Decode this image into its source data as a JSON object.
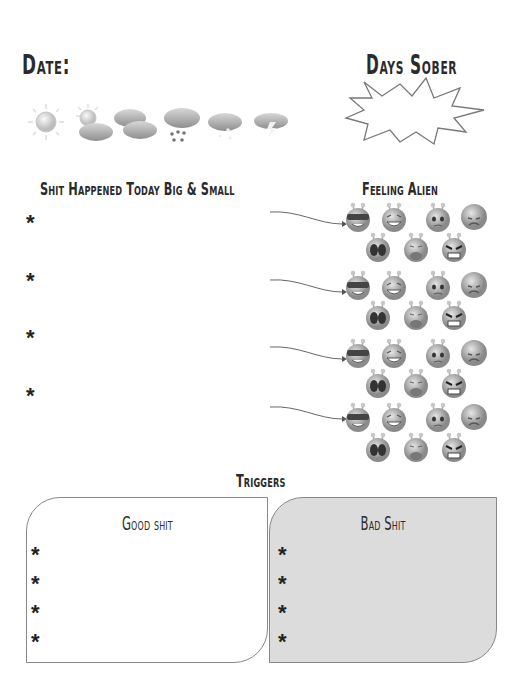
{
  "header": {
    "date_label": "Date:",
    "days_sober_label": "Days Sober",
    "days_sober_value": ""
  },
  "weather": {
    "icons": [
      "sunny-icon",
      "partly-cloudy-icon",
      "cloudy-icon",
      "rain-icon",
      "snow-icon",
      "thunderstorm-icon"
    ]
  },
  "events": {
    "title": "Shit Happened Today Big & Small",
    "bullet": "*",
    "items": [
      "",
      "",
      "",
      ""
    ]
  },
  "feelings": {
    "title": "Feeling Alien",
    "faces": [
      "cool-alien",
      "laughing-alien",
      "worried-alien",
      "sad-alien",
      "shocked-alien",
      "crying-alien",
      "angry-alien"
    ]
  },
  "triggers": {
    "title": "Triggers",
    "good": {
      "title": "Good shit",
      "items": [
        "",
        "",
        "",
        ""
      ]
    },
    "bad": {
      "title": "Bad Shit",
      "items": [
        "",
        "",
        "",
        ""
      ]
    },
    "bullet": "*"
  },
  "colors": {
    "text": "#2b2b2b",
    "bad_box_fill": "#dcdcdc",
    "outline": "#888888"
  }
}
